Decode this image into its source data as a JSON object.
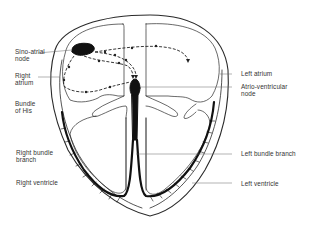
{
  "diagram": {
    "colors": {
      "line": "#2a2a2a",
      "thin_line": "#555555",
      "fill": "#111111",
      "background": "#ffffff"
    }
  },
  "labels": {
    "left": [
      {
        "id": "sino-atrial-node",
        "lines": [
          "Sino-atrial",
          "node"
        ]
      },
      {
        "id": "right-atrium",
        "lines": [
          "Right",
          "atrium"
        ]
      },
      {
        "id": "bundle-of-his",
        "lines": [
          "Bundle",
          "of His"
        ]
      },
      {
        "id": "right-bundle-branch",
        "lines": [
          "Right bundle",
          "branch"
        ]
      },
      {
        "id": "right-ventricle",
        "lines": [
          "Right ventricle"
        ]
      }
    ],
    "right": [
      {
        "id": "left-atrium",
        "lines": [
          "Left atrium"
        ]
      },
      {
        "id": "atrio-ventricular-node",
        "lines": [
          "Atrio-ventricular",
          "node"
        ]
      },
      {
        "id": "left-bundle-branch",
        "lines": [
          "Left bundle branch"
        ]
      },
      {
        "id": "left-ventricle",
        "lines": [
          "Left ventricle"
        ]
      }
    ]
  }
}
